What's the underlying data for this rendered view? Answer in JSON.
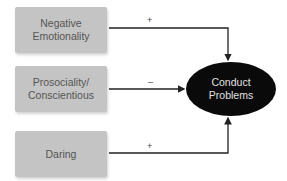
{
  "diagram": {
    "predictors": [
      {
        "id": "negative-emotionality",
        "label": "Negative\nEmotionality",
        "sign": "+"
      },
      {
        "id": "prosociality-conscientious",
        "label": "Prosociality/\nConscientious",
        "sign": "–"
      },
      {
        "id": "daring",
        "label": "Daring",
        "sign": "+"
      }
    ],
    "outcome": {
      "label": "Conduct\nProblems"
    },
    "colors": {
      "predictor_box": "#c4c4c4",
      "outcome_fill": "#0a0a0a",
      "outcome_text": "#e0e0e0",
      "lines": "#222222"
    }
  }
}
